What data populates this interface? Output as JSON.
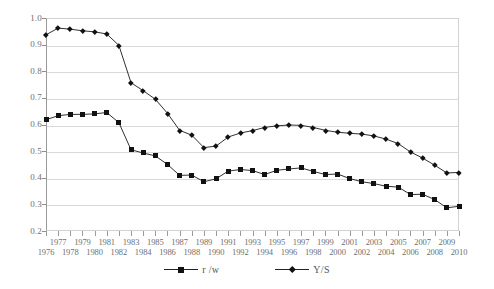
{
  "chart_data": {
    "type": "line",
    "title": "",
    "xlabel": "",
    "ylabel": "",
    "ylim": [
      0.2,
      1.0
    ],
    "ytick_labels": [
      "1.0",
      "0.9",
      "0.8",
      "0.7",
      "0.6",
      "0.5",
      "0.4",
      "0.3",
      "0.2"
    ],
    "ytick_values": [
      1.0,
      0.9,
      0.8,
      0.7,
      0.6,
      0.5,
      0.4,
      0.3,
      0.2
    ],
    "grid": true,
    "legend_position": "bottom",
    "categories": [
      "1976",
      "1977",
      "1978",
      "1979",
      "1980",
      "1981",
      "1982",
      "1983",
      "1984",
      "1985",
      "1986",
      "1987",
      "1988",
      "1989",
      "1990",
      "1991",
      "1992",
      "1993",
      "1994",
      "1995",
      "1996",
      "1997",
      "1998",
      "1999",
      "2000",
      "2001",
      "2002",
      "2003",
      "2004",
      "2005",
      "2006",
      "2007",
      "2008",
      "2009",
      "2010"
    ],
    "series": [
      {
        "name": "r /w",
        "marker": "square",
        "values": [
          0.618,
          0.633,
          0.638,
          0.638,
          0.64,
          0.645,
          0.607,
          0.505,
          0.493,
          0.482,
          0.45,
          0.409,
          0.41,
          0.385,
          0.396,
          0.425,
          0.431,
          0.427,
          0.412,
          0.428,
          0.433,
          0.437,
          0.424,
          0.412,
          0.414,
          0.397,
          0.385,
          0.378,
          0.368,
          0.365,
          0.337,
          0.338,
          0.318,
          0.287,
          0.293
        ]
      },
      {
        "name": "Y/S",
        "marker": "diamond",
        "values": [
          0.937,
          0.962,
          0.958,
          0.952,
          0.948,
          0.94,
          0.897,
          0.757,
          0.727,
          0.695,
          0.642,
          0.578,
          0.56,
          0.513,
          0.519,
          0.553,
          0.568,
          0.577,
          0.589,
          0.595,
          0.598,
          0.597,
          0.589,
          0.578,
          0.571,
          0.567,
          0.564,
          0.557,
          0.545,
          0.528,
          0.497,
          0.474,
          0.447,
          0.418,
          0.42
        ]
      }
    ]
  },
  "legend": {
    "items": [
      {
        "label": "r /w",
        "marker": "square"
      },
      {
        "label": "Y/S",
        "marker": "diamond"
      }
    ]
  }
}
